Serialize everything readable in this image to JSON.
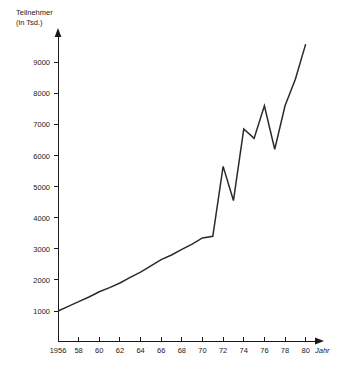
{
  "chart_data": {
    "type": "line",
    "title": "",
    "ylabel": "Teilnehmer (in Tsd.)",
    "ylabel_line1": "Teilnehmer",
    "ylabel_line2": "(in Tsd.)",
    "xlabel": "Jahr",
    "grid": false,
    "legend": "none",
    "xlim": [
      1956,
      1981
    ],
    "ylim": [
      0,
      9800
    ],
    "yticks": [
      1000,
      2000,
      3000,
      4000,
      5000,
      6000,
      7000,
      8000,
      9000
    ],
    "ytick_labels": [
      "1000",
      "2000",
      "3000",
      "4000",
      "5000",
      "6000",
      "7000",
      "8000",
      "9000"
    ],
    "xticks": [
      1956,
      1958,
      1960,
      1962,
      1964,
      1966,
      1968,
      1970,
      1972,
      1974,
      1976,
      1978,
      1980
    ],
    "xtick_labels": [
      "1956",
      "58",
      "60",
      "62",
      "64",
      "66",
      "68",
      "70",
      "72",
      "74",
      "76",
      "78",
      "80"
    ],
    "series": [
      {
        "name": "Teilnehmer",
        "x": [
          1956,
          1957,
          1958,
          1959,
          1960,
          1961,
          1962,
          1963,
          1964,
          1965,
          1966,
          1967,
          1968,
          1969,
          1970,
          1971,
          1972,
          1973,
          1974,
          1975,
          1976,
          1977,
          1978,
          1979,
          1980
        ],
        "values": [
          1000,
          1150,
          1300,
          1450,
          1620,
          1750,
          1900,
          2080,
          2250,
          2450,
          2650,
          2800,
          2980,
          3150,
          3350,
          3400,
          5650,
          4550,
          6850,
          6550,
          7600,
          6200,
          7600,
          8450,
          9580
        ]
      }
    ],
    "colors": {
      "line": "#2b2b2b",
      "axis": "#1a1a1a",
      "background": "#ffffff"
    }
  }
}
